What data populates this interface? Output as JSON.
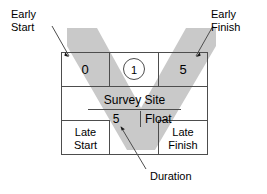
{
  "diagram": {
    "node": {
      "early_start": "0",
      "activity_id": "1",
      "early_finish": "5",
      "name": "Survey Site",
      "duration": "5",
      "float_label": "Float",
      "late_start": "Late\nStart",
      "late_finish": "Late\nFinish"
    },
    "callouts": {
      "early_start": "Early\nStart",
      "early_finish": "Early\nFinish",
      "duration": "Duration"
    },
    "colors": {
      "highlight_band": "#c9c9c9",
      "stroke": "#4d4d4d",
      "text": "#000000",
      "background": "#ffffff"
    }
  }
}
